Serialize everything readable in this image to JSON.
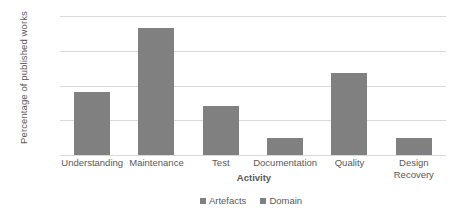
{
  "chart_data": {
    "type": "bar",
    "title": "",
    "categories": [
      "Understanding",
      "Maintenance",
      "Test",
      "Documentation",
      "Quality",
      "Design Recovery"
    ],
    "series": [
      {
        "name": "Artefacts",
        "values": [
          18,
          36.5,
          14,
          5,
          23.5,
          5
        ],
        "color": "#808080"
      },
      {
        "name": "Domain",
        "values": [
          0,
          0,
          0,
          0,
          0,
          0
        ],
        "color": "#808080"
      }
    ],
    "xlabel": "Activity",
    "ylabel": "Percentage of published works",
    "ylim": [
      0,
      40
    ],
    "ytick_labels": [
      "0%",
      "10%",
      "20%",
      "30%",
      "40%"
    ],
    "ytick_values": [
      0,
      10,
      20,
      30,
      40
    ],
    "grid": true,
    "legend_position": "bottom",
    "legend": [
      "Artefacts",
      "Domain"
    ]
  },
  "axes": {
    "y_title": "Percentage of published works",
    "x_title": "Activity"
  },
  "categories": [
    {
      "label": "Understanding",
      "line1": "Understanding",
      "line2": ""
    },
    {
      "label": "Maintenance",
      "line1": "Maintenance",
      "line2": ""
    },
    {
      "label": "Test",
      "line1": "Test",
      "line2": ""
    },
    {
      "label": "Documentation",
      "line1": "Documentation",
      "line2": ""
    },
    {
      "label": "Quality",
      "line1": "Quality",
      "line2": ""
    },
    {
      "label": "Design Recovery",
      "line1": "Design",
      "line2": "Recovery"
    }
  ],
  "ticks": [
    {
      "label": "40%",
      "value": 40
    },
    {
      "label": "30%",
      "value": 30
    },
    {
      "label": "20%",
      "value": 20
    },
    {
      "label": "10%",
      "value": 10
    },
    {
      "label": "0%",
      "value": 0
    }
  ],
  "legend_items": [
    {
      "label": "Artefacts",
      "color": "#808080"
    },
    {
      "label": "Domain",
      "color": "#808080"
    }
  ],
  "colors": {
    "bar": "#808080",
    "gridline": "#d9d9d9",
    "text": "#595959",
    "background": "#ffffff"
  }
}
